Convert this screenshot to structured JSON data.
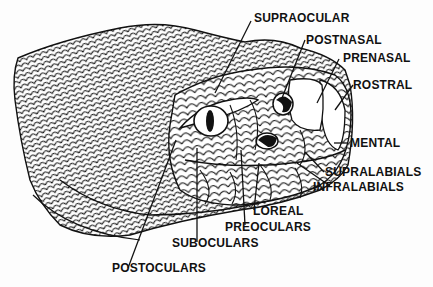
{
  "diagram": {
    "labels": {
      "supraocular": "SUPRAOCULAR",
      "postnasal": "POSTNASAL",
      "prenasal": "PRENASAL",
      "rostral": "ROSTRAL",
      "mental": "MENTAL",
      "supralabials": "SUPRALABIALS",
      "infralabials": "INFRALABIALS",
      "loreal": "LOREAL",
      "preoculars": "PREOCULARS",
      "suboculars": "SUBOCULARS",
      "postoculars": "POSTOCULARS"
    }
  }
}
